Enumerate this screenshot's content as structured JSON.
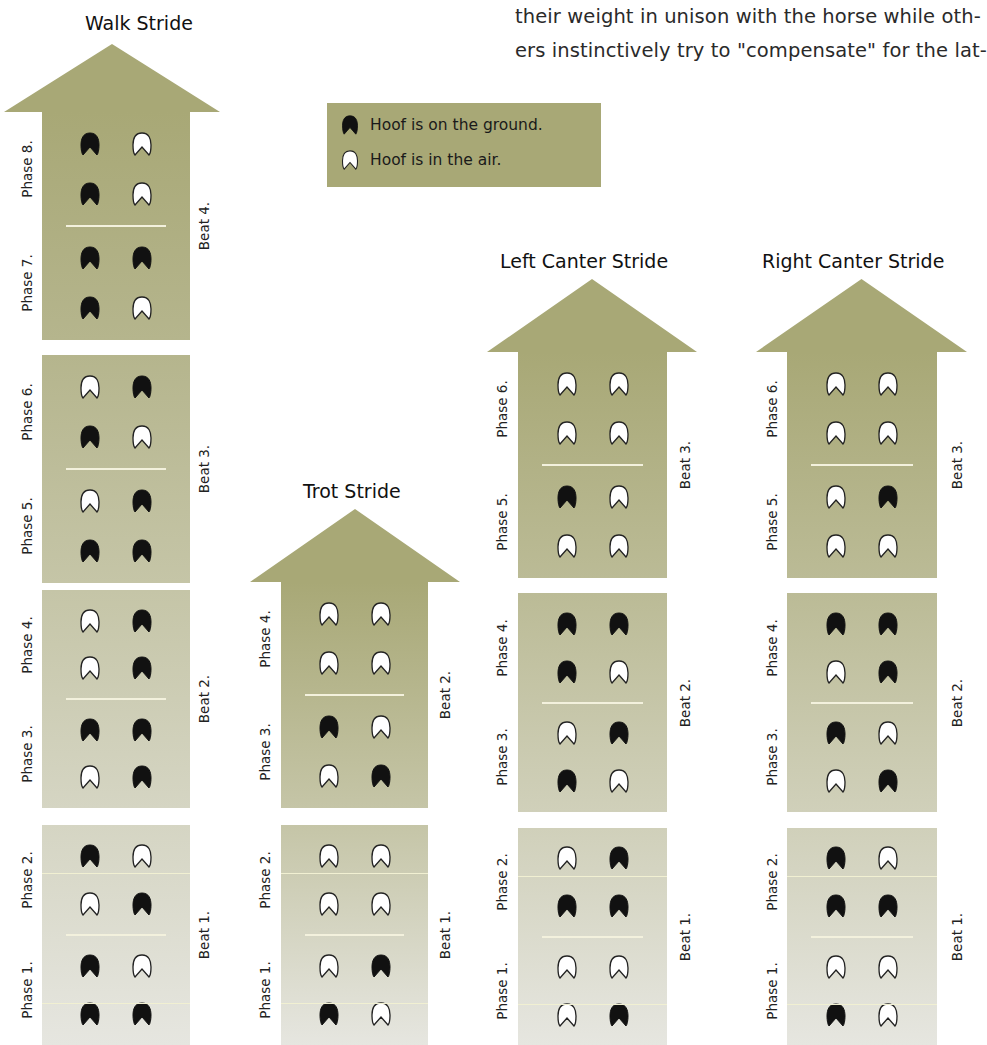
{
  "paragraph": {
    "lines": [
      "their weight in unison with the horse while oth-",
      "ers instinctively try to \"compensate\" for the lat-"
    ]
  },
  "legend": {
    "ground_label": "Hoof is on the ground.",
    "air_label": "Hoof is in the air.",
    "icons": {
      "ground": "hoof-filled-icon",
      "air": "hoof-outline-icon"
    }
  },
  "colors": {
    "arrow_top": "#a8a876",
    "block_mid": "#b2b29a",
    "block_low": "#c4c4b2",
    "block_bottom": "#e2e2da",
    "hoof_ground": "#111111",
    "hoof_air": "#ffffff",
    "divider": "#f3f1dd"
  },
  "strides": [
    {
      "id": "walk",
      "title": "Walk Stride",
      "beats": [
        "Beat 4.",
        "Beat 3.",
        "Beat 2.",
        "Beat 1."
      ],
      "phases": [
        {
          "label": "Phase 8.",
          "rows": [
            [
              "ground",
              "air"
            ],
            [
              "ground",
              "air"
            ]
          ]
        },
        {
          "label": "Phase 7.",
          "rows": [
            [
              "ground",
              "ground"
            ],
            [
              "ground",
              "air"
            ]
          ]
        },
        {
          "label": "Phase 6.",
          "rows": [
            [
              "air",
              "ground"
            ],
            [
              "ground",
              "air"
            ]
          ]
        },
        {
          "label": "Phase 5.",
          "rows": [
            [
              "air",
              "ground"
            ],
            [
              "ground",
              "ground"
            ]
          ]
        },
        {
          "label": "Phase 4.",
          "rows": [
            [
              "air",
              "ground"
            ],
            [
              "air",
              "ground"
            ]
          ]
        },
        {
          "label": "Phase 3.",
          "rows": [
            [
              "ground",
              "ground"
            ],
            [
              "air",
              "ground"
            ]
          ]
        },
        {
          "label": "Phase 2.",
          "rows": [
            [
              "ground",
              "air"
            ],
            [
              "air",
              "ground"
            ]
          ]
        },
        {
          "label": "Phase 1.",
          "rows": [
            [
              "ground",
              "air"
            ],
            [
              "ground",
              "ground"
            ]
          ]
        }
      ]
    },
    {
      "id": "trot",
      "title": "Trot Stride",
      "beats": [
        "Beat 2.",
        "Beat 1."
      ],
      "phases": [
        {
          "label": "Phase 4.",
          "rows": [
            [
              "air",
              "air"
            ],
            [
              "air",
              "air"
            ]
          ]
        },
        {
          "label": "Phase 3.",
          "rows": [
            [
              "ground",
              "air"
            ],
            [
              "air",
              "ground"
            ]
          ]
        },
        {
          "label": "Phase 2.",
          "rows": [
            [
              "air",
              "air"
            ],
            [
              "air",
              "air"
            ]
          ]
        },
        {
          "label": "Phase 1.",
          "rows": [
            [
              "air",
              "ground"
            ],
            [
              "ground",
              "air"
            ]
          ]
        }
      ]
    },
    {
      "id": "left-canter",
      "title": "Left Canter Stride",
      "beats": [
        "Beat 3.",
        "Beat 2.",
        "Beat 1."
      ],
      "phases": [
        {
          "label": "Phase 6.",
          "rows": [
            [
              "air",
              "air"
            ],
            [
              "air",
              "air"
            ]
          ]
        },
        {
          "label": "Phase 5.",
          "rows": [
            [
              "ground",
              "air"
            ],
            [
              "air",
              "air"
            ]
          ]
        },
        {
          "label": "Phase 4.",
          "rows": [
            [
              "ground",
              "ground"
            ],
            [
              "ground",
              "air"
            ]
          ]
        },
        {
          "label": "Phase 3.",
          "rows": [
            [
              "air",
              "ground"
            ],
            [
              "ground",
              "air"
            ]
          ]
        },
        {
          "label": "Phase 2.",
          "rows": [
            [
              "air",
              "ground"
            ],
            [
              "ground",
              "ground"
            ]
          ]
        },
        {
          "label": "Phase 1.",
          "rows": [
            [
              "air",
              "air"
            ],
            [
              "air",
              "ground"
            ]
          ]
        }
      ]
    },
    {
      "id": "right-canter",
      "title": "Right Canter Stride",
      "beats": [
        "Beat 3.",
        "Beat 2.",
        "Beat 1."
      ],
      "phases": [
        {
          "label": "Phase 6.",
          "rows": [
            [
              "air",
              "air"
            ],
            [
              "air",
              "air"
            ]
          ]
        },
        {
          "label": "Phase 5.",
          "rows": [
            [
              "air",
              "ground"
            ],
            [
              "air",
              "air"
            ]
          ]
        },
        {
          "label": "Phase 4.",
          "rows": [
            [
              "ground",
              "ground"
            ],
            [
              "air",
              "ground"
            ]
          ]
        },
        {
          "label": "Phase 3.",
          "rows": [
            [
              "ground",
              "air"
            ],
            [
              "air",
              "ground"
            ]
          ]
        },
        {
          "label": "Phase 2.",
          "rows": [
            [
              "ground",
              "air"
            ],
            [
              "ground",
              "ground"
            ]
          ]
        },
        {
          "label": "Phase 1.",
          "rows": [
            [
              "air",
              "air"
            ],
            [
              "ground",
              "air"
            ]
          ]
        }
      ]
    }
  ]
}
